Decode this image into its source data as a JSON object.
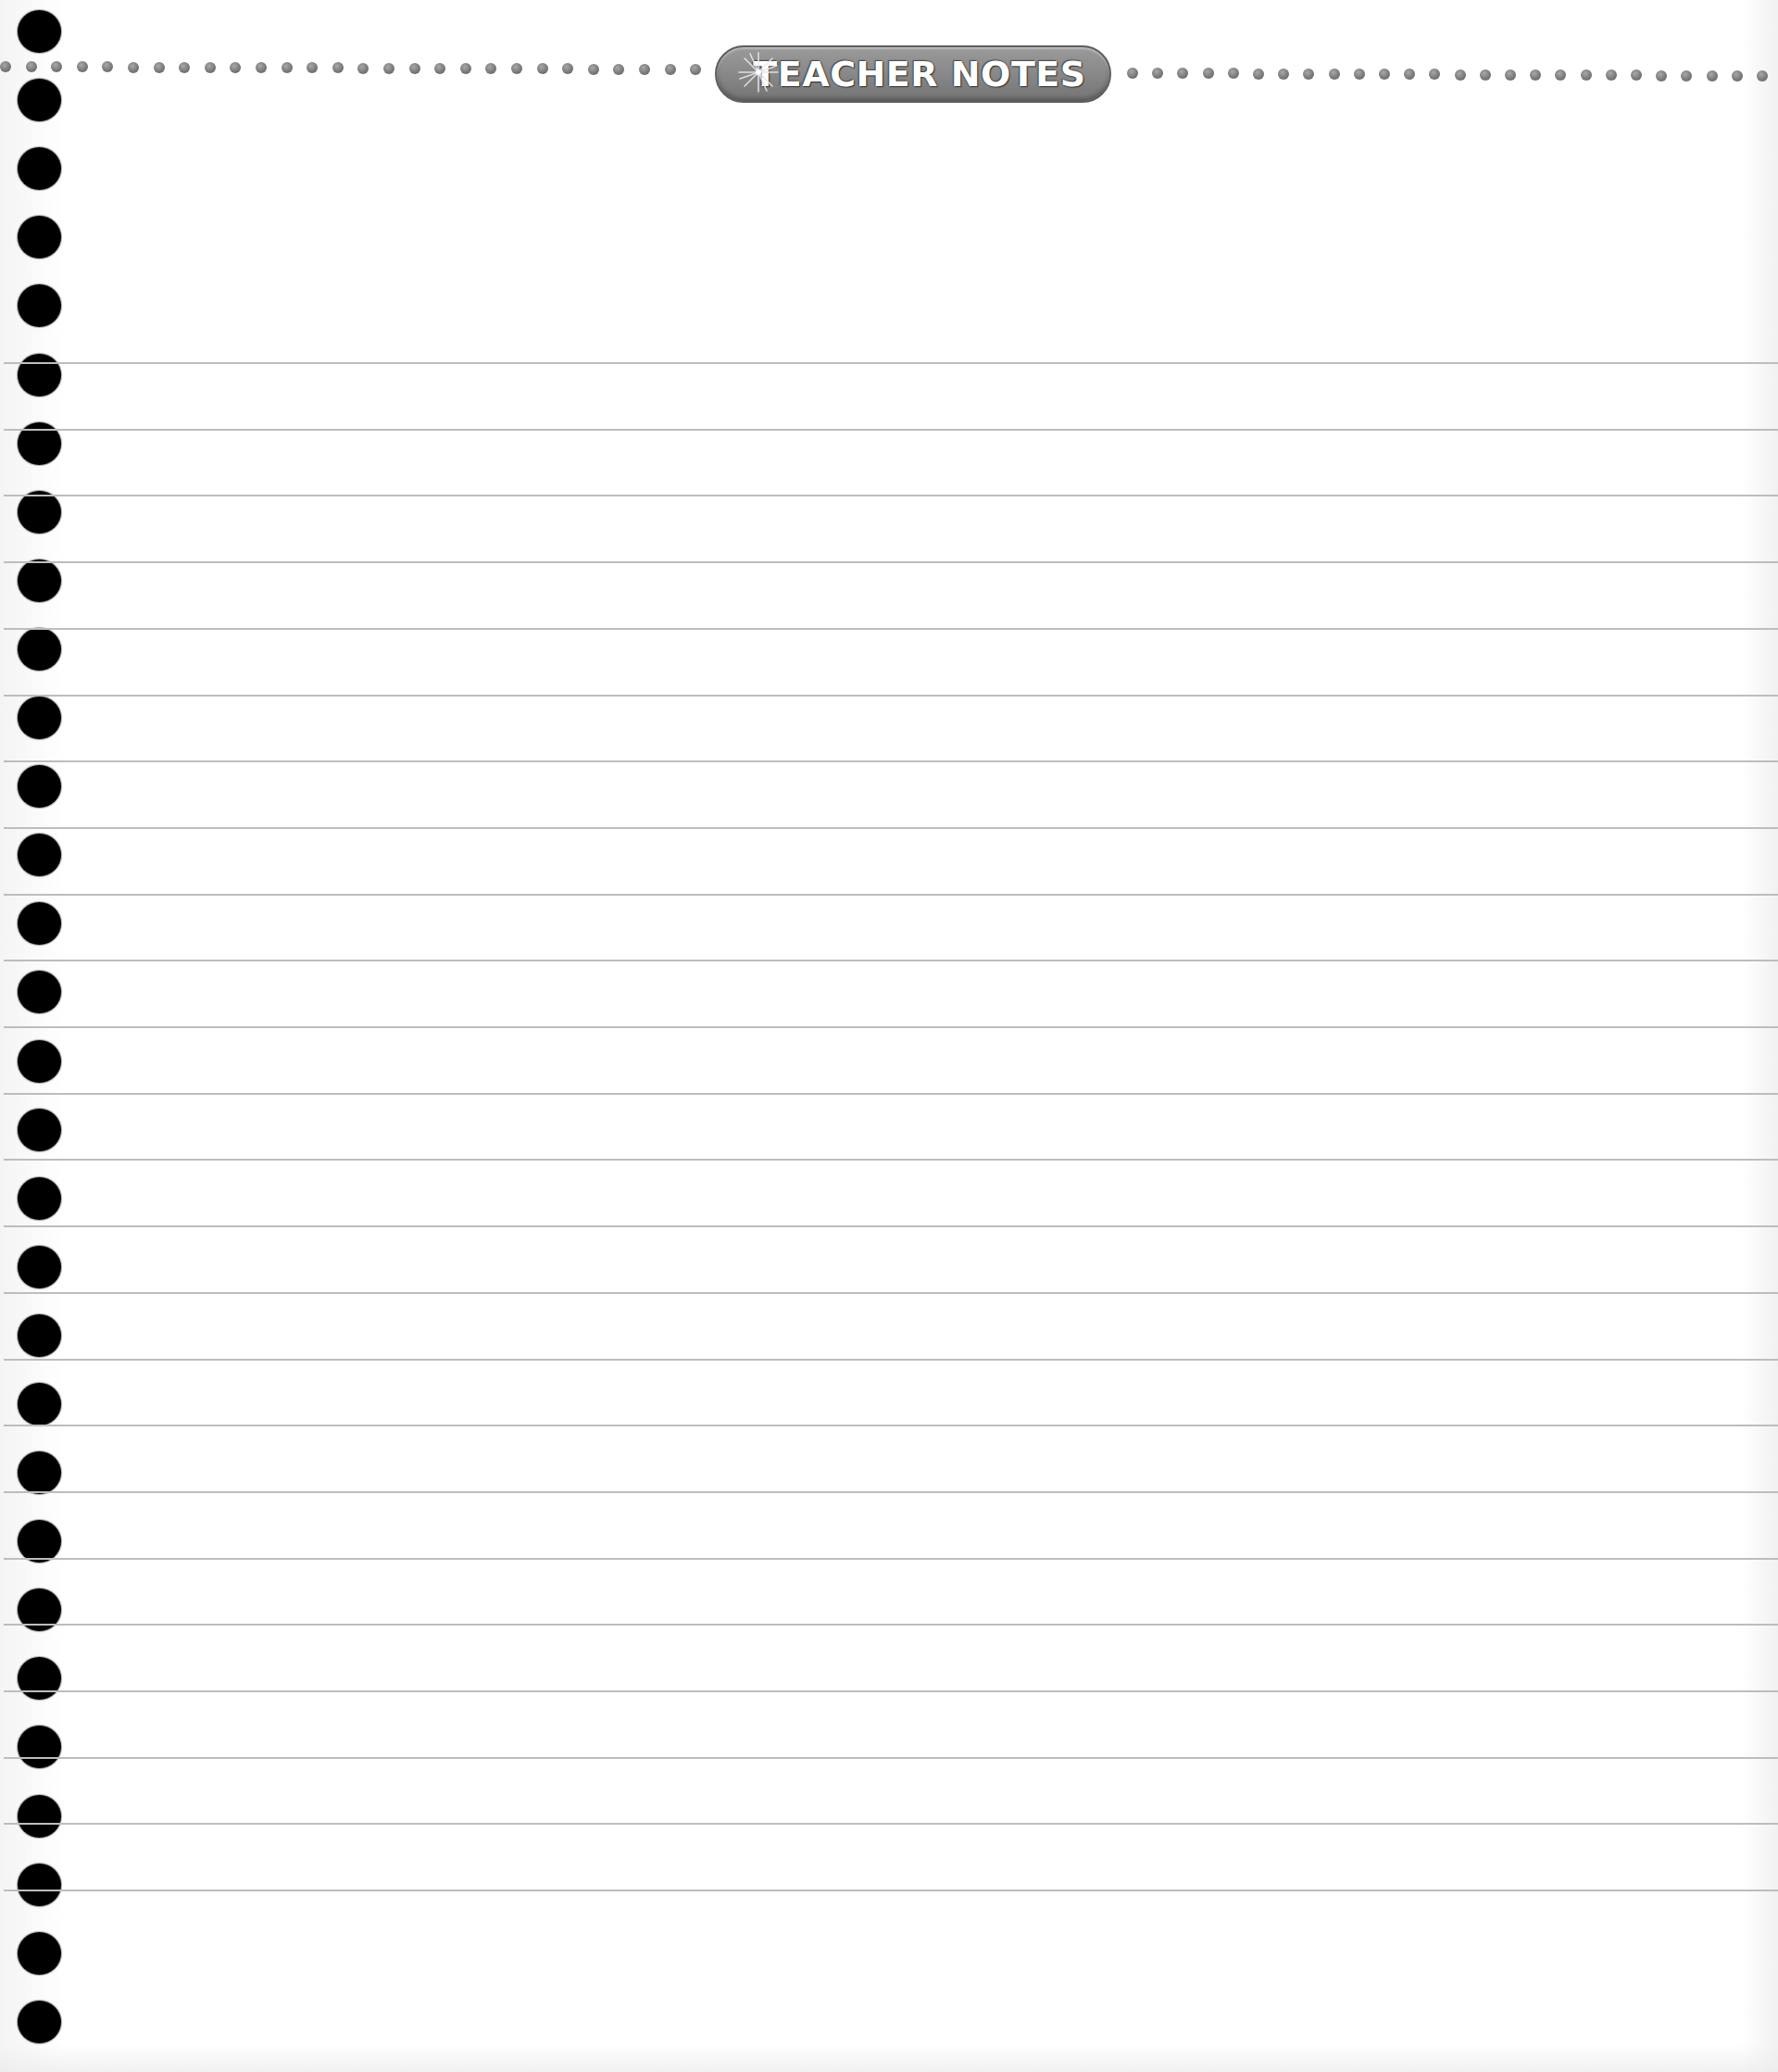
{
  "header": {
    "title": "TEACHER NOTES",
    "badge_icon": "sparkle-icon"
  },
  "colors": {
    "badge_fill": "#8a8a8a",
    "dot_fill": "#7a7a7a",
    "rule_line": "#bdbdbd",
    "hole_fill": "#000000",
    "background": "#ffffff"
  },
  "binder_holes": {
    "count": 30,
    "center_x": 42,
    "first_center_y": 34,
    "spacing": 74.1
  },
  "ruled_lines": {
    "count": 24,
    "first_y": 391,
    "spacing": 71.7
  },
  "dot_rows": {
    "left": {
      "start_x": 0,
      "end_x": 760,
      "spacing": 27.6,
      "y_start": 72,
      "y_end": 75
    },
    "right": {
      "start_x": 1217,
      "end_x": 1920,
      "spacing": 27.2,
      "y_start": 79,
      "y_end": 82
    }
  }
}
